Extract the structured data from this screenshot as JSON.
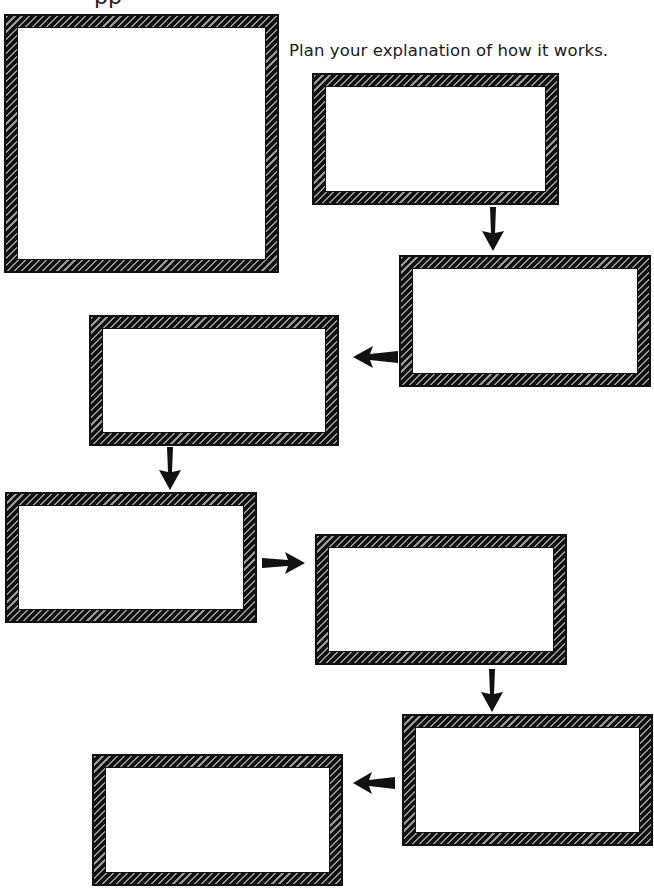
{
  "page": {
    "top_clipped_text": "pp",
    "instruction": "Plan your explanation of how it works."
  },
  "diagram": {
    "type": "flowchart-worksheet",
    "frame_style": "hand-drawn hatched border",
    "colors": {
      "frame": "#111111",
      "background": "#ffffff",
      "text": "#1a1a1a"
    },
    "picture_box": {
      "label": "",
      "content": ""
    },
    "steps": [
      {
        "id": 1,
        "content": ""
      },
      {
        "id": 2,
        "content": ""
      },
      {
        "id": 3,
        "content": ""
      },
      {
        "id": 4,
        "content": ""
      },
      {
        "id": 5,
        "content": ""
      },
      {
        "id": 6,
        "content": ""
      },
      {
        "id": 7,
        "content": ""
      }
    ],
    "arrows": [
      {
        "from": 1,
        "to": 2,
        "direction": "down"
      },
      {
        "from": 2,
        "to": 3,
        "direction": "left"
      },
      {
        "from": 3,
        "to": 4,
        "direction": "down"
      },
      {
        "from": 4,
        "to": 5,
        "direction": "right"
      },
      {
        "from": 5,
        "to": 6,
        "direction": "down"
      },
      {
        "from": 6,
        "to": 7,
        "direction": "left"
      }
    ]
  }
}
